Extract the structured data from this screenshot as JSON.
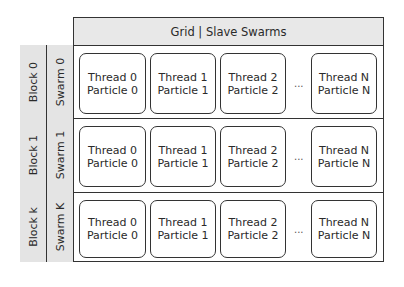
{
  "header": {
    "title": "Grid | Slave Swarms"
  },
  "rows": [
    {
      "block": "Block 0",
      "swarm": "Swarm 0",
      "cards": [
        {
          "thread": "Thread 0",
          "particle": "Particle 0"
        },
        {
          "thread": "Thread 1",
          "particle": "Particle 1"
        },
        {
          "thread": "Thread 2",
          "particle": "Particle 2"
        },
        {
          "thread": "Thread N",
          "particle": "Particle N"
        }
      ],
      "ellipsis": "..."
    },
    {
      "block": "Block 1",
      "swarm": "Swarm 1",
      "cards": [
        {
          "thread": "Thread 0",
          "particle": "Particle 0"
        },
        {
          "thread": "Thread 1",
          "particle": "Particle 1"
        },
        {
          "thread": "Thread 2",
          "particle": "Particle 2"
        },
        {
          "thread": "Thread N",
          "particle": "Particle N"
        }
      ],
      "ellipsis": "..."
    },
    {
      "block": "Block k",
      "swarm": "Swarm K",
      "cards": [
        {
          "thread": "Thread 0",
          "particle": "Particle 0"
        },
        {
          "thread": "Thread 1",
          "particle": "Particle 1"
        },
        {
          "thread": "Thread 2",
          "particle": "Particle 2"
        },
        {
          "thread": "Thread N",
          "particle": "Particle N"
        }
      ],
      "ellipsis": "..."
    }
  ]
}
